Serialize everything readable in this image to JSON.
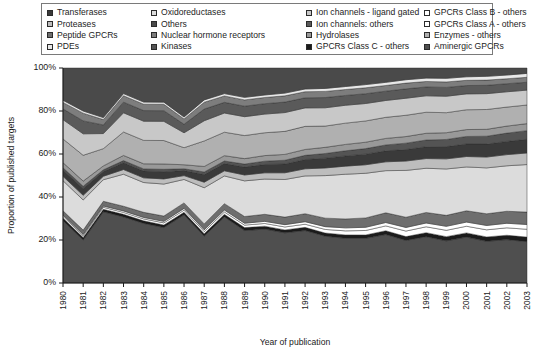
{
  "legend": {
    "columns": 4,
    "entries": [
      {
        "label": "Transferases",
        "color": "#3a3a3a",
        "row": 0,
        "col": 0
      },
      {
        "label": "Oxidoreductases",
        "color": "#dcdcdc",
        "row": 0,
        "col": 1
      },
      {
        "label": "Ion channels - ligand gated",
        "color": "#c8c8c8",
        "row": 0,
        "col": 2
      },
      {
        "label": "GPCRs Class B - others",
        "color": "#ffffff",
        "row": 0,
        "col": 3
      },
      {
        "label": "Proteases",
        "color": "#bdbdbd",
        "row": 1,
        "col": 0
      },
      {
        "label": "Others",
        "color": "#4a4a4a",
        "row": 1,
        "col": 1
      },
      {
        "label": "Ion channels: others",
        "color": "#5a5a5a",
        "row": 1,
        "col": 2
      },
      {
        "label": "GPCRs Class A - others",
        "color": "#ffffff",
        "row": 1,
        "col": 3
      },
      {
        "label": "Peptide GPCRs",
        "color": "#6e6e6e",
        "row": 2,
        "col": 0
      },
      {
        "label": "Nuclear hormone receptors",
        "color": "#7d7d7d",
        "row": 2,
        "col": 1
      },
      {
        "label": "Hydrolases",
        "color": "#999999",
        "row": 2,
        "col": 2
      },
      {
        "label": "Enzymes - others",
        "color": "#b0b0b0",
        "row": 2,
        "col": 3
      },
      {
        "label": "PDEs",
        "color": "#e8e8e8",
        "row": 3,
        "col": 0
      },
      {
        "label": "Kinases",
        "color": "#545454",
        "row": 3,
        "col": 1
      },
      {
        "label": "GPCRs Class C - others",
        "color": "#1b1b1b",
        "row": 3,
        "col": 2
      },
      {
        "label": "Aminergic GPCRs",
        "color": "#4f4f4f",
        "row": 3,
        "col": 3
      }
    ]
  },
  "chart_data": {
    "type": "area",
    "title": "",
    "xlabel": "Year of publication",
    "ylabel": "Proportion of published targets",
    "stacked": true,
    "normalized": true,
    "ylim": [
      0,
      100
    ],
    "yticks": [
      0,
      20,
      40,
      60,
      80,
      100
    ],
    "ytick_labels": [
      "0%",
      "20%",
      "40%",
      "60%",
      "80%",
      "100%"
    ],
    "grid": false,
    "legend_position": "top",
    "x": [
      1980,
      1981,
      1982,
      1983,
      1984,
      1985,
      1986,
      1987,
      1988,
      1989,
      1990,
      1991,
      1992,
      1993,
      1994,
      1995,
      1996,
      1997,
      1998,
      1999,
      2000,
      2001,
      2002,
      2003
    ],
    "series": [
      {
        "name": "Aminergic GPCRs",
        "color": "#4f4f4f",
        "values": [
          29,
          20,
          33,
          31,
          28,
          26,
          32,
          22,
          31,
          25,
          26,
          24,
          25,
          22,
          21,
          21,
          23,
          20,
          22,
          20,
          22,
          20,
          21,
          20
        ]
      },
      {
        "name": "GPCRs Class C - others",
        "color": "#1b1b1b",
        "values": [
          1.2,
          1.2,
          1.2,
          1.2,
          1.2,
          1.2,
          1.2,
          1.2,
          1.2,
          1.4,
          1.4,
          1.4,
          1.5,
          1.5,
          1.6,
          1.6,
          1.8,
          1.8,
          1.9,
          2.0,
          2.0,
          2.1,
          2.1,
          2.2
        ]
      },
      {
        "name": "GPCRs Class B - others",
        "color": "#ffffff",
        "values": [
          0.8,
          0.8,
          0.9,
          0.9,
          0.9,
          1.0,
          1.0,
          1.0,
          1.1,
          1.2,
          1.3,
          1.4,
          1.5,
          1.7,
          1.9,
          2.1,
          2.3,
          2.6,
          2.8,
          3.0,
          3.2,
          3.4,
          3.6,
          3.8
        ]
      },
      {
        "name": "GPCRs Class A - others",
        "color": "#ffffff",
        "values": [
          0.6,
          0.6,
          0.6,
          0.7,
          0.7,
          0.7,
          0.8,
          0.8,
          0.9,
          0.9,
          1.0,
          1.1,
          1.2,
          1.3,
          1.4,
          1.5,
          1.6,
          1.7,
          1.8,
          1.9,
          2.0,
          2.1,
          2.2,
          2.3
        ]
      },
      {
        "name": "Peptide GPCRs",
        "color": "#6e6e6e",
        "values": [
          2.0,
          2.0,
          2.2,
          2.2,
          2.4,
          2.5,
          2.6,
          2.8,
          3.0,
          3.2,
          3.4,
          3.6,
          3.8,
          4.0,
          4.2,
          4.4,
          4.6,
          4.8,
          5.0,
          5.2,
          5.4,
          5.6,
          5.8,
          6.0
        ]
      },
      {
        "name": "Oxidoreductases",
        "color": "#dcdcdc",
        "values": [
          14,
          14,
          10,
          15,
          14,
          15,
          11,
          17,
          13,
          17,
          17,
          18,
          18,
          20,
          21,
          21,
          20,
          22,
          21,
          22,
          21,
          22,
          22,
          23
        ]
      },
      {
        "name": "Proteases",
        "color": "#bdbdbd",
        "values": [
          2.0,
          2.2,
          1.6,
          2.2,
          2.2,
          2.4,
          1.8,
          2.6,
          2.4,
          2.8,
          3.0,
          3.2,
          3.4,
          3.6,
          3.8,
          4.0,
          4.2,
          4.4,
          4.6,
          4.8,
          5.0,
          5.2,
          5.4,
          5.6
        ]
      },
      {
        "name": "Transferases",
        "color": "#3a3a3a",
        "values": [
          3.0,
          3.2,
          2.2,
          3.2,
          3.2,
          3.4,
          2.4,
          3.6,
          3.4,
          3.8,
          4.0,
          4.2,
          4.4,
          4.6,
          4.8,
          5.0,
          5.2,
          5.4,
          5.6,
          5.8,
          6.0,
          6.2,
          6.4,
          6.6
        ]
      },
      {
        "name": "Kinases",
        "color": "#545454",
        "values": [
          1.0,
          1.0,
          0.8,
          1.0,
          1.0,
          1.1,
          0.8,
          1.2,
          1.2,
          1.4,
          1.6,
          1.8,
          2.0,
          2.2,
          2.4,
          2.6,
          2.8,
          3.0,
          3.2,
          3.4,
          3.6,
          3.8,
          4.0,
          4.2
        ]
      },
      {
        "name": "Hydrolases",
        "color": "#999999",
        "values": [
          2.4,
          2.4,
          1.8,
          2.4,
          2.4,
          2.5,
          1.9,
          2.6,
          2.5,
          2.6,
          2.7,
          2.8,
          2.8,
          2.9,
          3.0,
          3.0,
          3.1,
          3.1,
          3.2,
          3.2,
          3.3,
          3.3,
          3.4,
          3.4
        ]
      },
      {
        "name": "Enzymes - others",
        "color": "#b0b0b0",
        "values": [
          11,
          12,
          8,
          11,
          11,
          11,
          8,
          12,
          11,
          11,
          11,
          11,
          11,
          10,
          10,
          10,
          10,
          10,
          10,
          9.5,
          9.5,
          9.5,
          9.2,
          9.0
        ]
      },
      {
        "name": "Ion channels - ligand gated",
        "color": "#c8c8c8",
        "values": [
          9.0,
          10,
          7.0,
          9.0,
          9.0,
          9.0,
          7.0,
          9.5,
          9.0,
          9.0,
          9.0,
          9.0,
          8.8,
          8.6,
          8.4,
          8.2,
          8.0,
          8.0,
          7.8,
          7.8,
          7.6,
          7.6,
          7.4,
          7.2
        ]
      },
      {
        "name": "Ion channels: others",
        "color": "#5a5a5a",
        "values": [
          5.0,
          6.0,
          4.0,
          5.0,
          5.0,
          5.0,
          4.0,
          5.5,
          5.0,
          5.0,
          5.0,
          5.0,
          4.8,
          4.8,
          4.6,
          4.6,
          4.4,
          4.4,
          4.2,
          4.2,
          4.0,
          4.0,
          3.9,
          3.8
        ]
      },
      {
        "name": "Nuclear hormone receptors",
        "color": "#7d7d7d",
        "values": [
          3.0,
          3.6,
          2.5,
          3.0,
          3.0,
          3.0,
          2.5,
          3.2,
          3.0,
          3.0,
          3.0,
          3.0,
          2.9,
          2.9,
          2.8,
          2.8,
          2.7,
          2.7,
          2.6,
          2.6,
          2.5,
          2.5,
          2.4,
          2.4
        ]
      },
      {
        "name": "PDEs",
        "color": "#e8e8e8",
        "values": [
          1.0,
          1.0,
          0.9,
          1.0,
          1.0,
          1.0,
          0.9,
          1.1,
          1.1,
          1.2,
          1.2,
          1.3,
          1.3,
          1.4,
          1.4,
          1.5,
          1.5,
          1.6,
          1.6,
          1.7,
          1.7,
          1.8,
          1.8,
          1.9
        ]
      },
      {
        "name": "Others",
        "color": "#4a4a4a",
        "values": [
          15,
          20,
          23,
          12,
          16,
          16,
          23,
          15,
          12,
          14,
          13,
          12,
          10,
          9.6,
          8.7,
          7.8,
          6.8,
          5.5,
          4.8,
          4.9,
          4.2,
          4.0,
          3.4,
          2.6
        ]
      }
    ]
  }
}
